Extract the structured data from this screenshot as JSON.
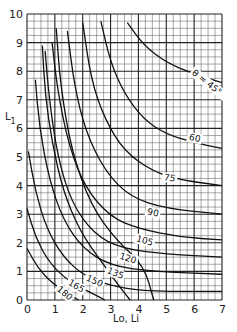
{
  "chart_data": {
    "type": "line",
    "title": "",
    "xlabel": "Lo, Li",
    "ylabel": "L1",
    "xlim": [
      0,
      7
    ],
    "ylim": [
      0,
      10
    ],
    "grid": true,
    "minor_grid_per_unit": 4,
    "x_ticks": [
      "0",
      "1",
      "2",
      "3",
      "4",
      "5",
      "6",
      "7"
    ],
    "y_ticks": [
      "0",
      "1",
      "2",
      "3",
      "4",
      "5",
      "6",
      "7",
      "8",
      "9",
      "10"
    ],
    "series": [
      {
        "name": "θ = 45°",
        "label": "θ = 45°",
        "label_pos": [
          5.9,
          7.9
        ],
        "label_rot": 38,
        "points": [
          [
            3.6,
            9.7
          ],
          [
            4.2,
            8.9
          ],
          [
            5.0,
            8.3
          ],
          [
            6.0,
            7.9
          ],
          [
            7.0,
            7.6
          ]
        ]
      },
      {
        "name": "60",
        "label": "60",
        "label_pos": [
          5.8,
          5.6
        ],
        "label_rot": 12,
        "points": [
          [
            2.65,
            9.75
          ],
          [
            3.0,
            8.3
          ],
          [
            3.5,
            7.2
          ],
          [
            4.2,
            6.3
          ],
          [
            5.0,
            5.8
          ],
          [
            6.0,
            5.5
          ],
          [
            7.0,
            5.3
          ]
        ]
      },
      {
        "name": "75",
        "label": "75",
        "label_pos": [
          4.9,
          4.2
        ],
        "label_rot": 10,
        "points": [
          [
            2.0,
            9.7
          ],
          [
            2.3,
            7.7
          ],
          [
            2.8,
            6.3
          ],
          [
            3.5,
            5.2
          ],
          [
            4.5,
            4.5
          ],
          [
            5.5,
            4.2
          ],
          [
            7.0,
            4.0
          ]
        ]
      },
      {
        "name": "90",
        "label": "90",
        "label_pos": [
          4.3,
          3.0
        ],
        "label_rot": 12,
        "points": [
          [
            1.45,
            9.4
          ],
          [
            1.7,
            7.5
          ],
          [
            2.1,
            5.9
          ],
          [
            2.8,
            4.5
          ],
          [
            3.7,
            3.6
          ],
          [
            5.0,
            3.2
          ],
          [
            7.0,
            3.0
          ]
        ]
      },
      {
        "name": "105",
        "label": "105",
        "label_pos": [
          3.9,
          2.05
        ],
        "label_rot": 15,
        "points": [
          [
            0.9,
            9.0
          ],
          [
            1.1,
            7.3
          ],
          [
            1.5,
            5.4
          ],
          [
            2.1,
            3.9
          ],
          [
            3.0,
            2.9
          ],
          [
            4.0,
            2.5
          ],
          [
            5.5,
            2.2
          ],
          [
            7.0,
            2.1
          ]
        ]
      },
      {
        "name": "120",
        "label": "120",
        "label_pos": [
          3.3,
          1.45
        ],
        "label_rot": 18,
        "points": [
          [
            0.65,
            8.7
          ],
          [
            0.8,
            7.0
          ],
          [
            1.1,
            5.0
          ],
          [
            1.6,
            3.4
          ],
          [
            2.4,
            2.3
          ],
          [
            3.4,
            1.8
          ],
          [
            5.0,
            1.6
          ],
          [
            7.0,
            1.5
          ]
        ]
      },
      {
        "name": "135",
        "label": "135",
        "label_pos": [
          2.85,
          0.95
        ],
        "label_rot": 22,
        "points": [
          [
            0.3,
            7.7
          ],
          [
            0.45,
            6.0
          ],
          [
            0.8,
            4.2
          ],
          [
            1.3,
            2.8
          ],
          [
            2.0,
            1.8
          ],
          [
            3.0,
            1.2
          ],
          [
            4.5,
            1.0
          ],
          [
            7.0,
            0.9
          ]
        ]
      },
      {
        "name": "150",
        "label": "150",
        "label_pos": [
          2.1,
          0.7
        ],
        "label_rot": 25,
        "points": [
          [
            0.05,
            5.2
          ],
          [
            0.3,
            3.8
          ],
          [
            0.7,
            2.5
          ],
          [
            1.3,
            1.5
          ],
          [
            2.1,
            0.8
          ],
          [
            3.2,
            0.45
          ],
          [
            4.5,
            0.3
          ],
          [
            7.0,
            0.3
          ]
        ]
      },
      {
        "name": "165",
        "label": "165",
        "label_pos": [
          1.45,
          0.55
        ],
        "label_rot": 30,
        "points": [
          [
            0.0,
            3.2
          ],
          [
            0.3,
            2.2
          ],
          [
            0.8,
            1.3
          ],
          [
            1.5,
            0.65
          ],
          [
            2.3,
            0.25
          ],
          [
            2.8,
            0.0
          ]
        ]
      },
      {
        "name": "180",
        "label": "180",
        "label_pos": [
          1.05,
          0.35
        ],
        "label_rot": 40,
        "points": [
          [
            0.0,
            1.8
          ],
          [
            0.4,
            1.1
          ],
          [
            0.9,
            0.6
          ],
          [
            1.4,
            0.25
          ],
          [
            1.85,
            0.0
          ]
        ]
      },
      {
        "name": "steep-a",
        "label": "",
        "points": [
          [
            1.05,
            9.5
          ],
          [
            1.2,
            7.5
          ],
          [
            1.6,
            5.2
          ],
          [
            2.3,
            3.3
          ],
          [
            3.2,
            2.1
          ],
          [
            4.2,
            1.2
          ],
          [
            4.55,
            0.0
          ]
        ]
      },
      {
        "name": "steep-b",
        "label": "",
        "points": [
          [
            0.55,
            8.9
          ],
          [
            0.65,
            7.2
          ],
          [
            0.9,
            5.5
          ],
          [
            1.3,
            3.8
          ],
          [
            1.9,
            2.4
          ],
          [
            2.7,
            1.3
          ],
          [
            3.3,
            0.5
          ],
          [
            3.7,
            0.0
          ]
        ]
      }
    ]
  },
  "axes": {
    "x_label_main": "Lo",
    "x_label_sep": ",",
    "x_label_sub": "Li",
    "y_label_main": "L",
    "y_label_sub": "1"
  }
}
